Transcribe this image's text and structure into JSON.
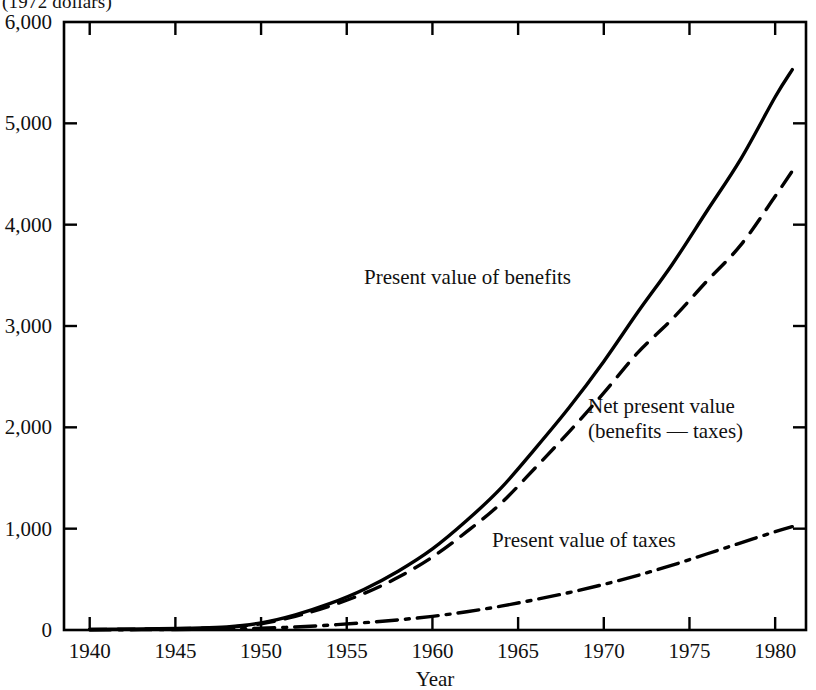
{
  "chart_data": {
    "type": "line",
    "title": "",
    "subtitle": "",
    "units_note": "(1972 dollars)",
    "xlabel": "Year",
    "ylabel": "",
    "xlim": [
      1938.5,
      1981.8
    ],
    "ylim": [
      0,
      6000
    ],
    "grid": false,
    "legend_position": "inline annotations",
    "xticks": [
      1940,
      1945,
      1950,
      1955,
      1960,
      1965,
      1970,
      1975,
      1980
    ],
    "xtick_labels": [
      "1940",
      "1945",
      "1950",
      "1955",
      "1960",
      "1965",
      "1970",
      "1975",
      "1980"
    ],
    "yticks": [
      0,
      1000,
      2000,
      3000,
      4000,
      5000,
      6000
    ],
    "ytick_labels": [
      "0",
      "1,000",
      "2,000",
      "3,000",
      "4,000",
      "5,000",
      "6,000"
    ],
    "x": [
      1940,
      1942,
      1944,
      1946,
      1948,
      1950,
      1952,
      1954,
      1956,
      1958,
      1960,
      1962,
      1964,
      1966,
      1968,
      1970,
      1972,
      1974,
      1976,
      1978,
      1980,
      1981
    ],
    "series": [
      {
        "name": "Present value of benefits",
        "style": "solid",
        "color": "#000000",
        "values": [
          5,
          8,
          12,
          18,
          30,
          70,
          150,
          260,
          400,
          580,
          800,
          1080,
          1400,
          1790,
          2200,
          2650,
          3140,
          3610,
          4130,
          4650,
          5260,
          5530
        ]
      },
      {
        "name": "Net present value (benefits − taxes)",
        "style": "dashed",
        "color": "#000000",
        "values": [
          5,
          8,
          11,
          16,
          26,
          62,
          135,
          235,
          360,
          520,
          720,
          970,
          1250,
          1600,
          1960,
          2340,
          2740,
          3070,
          3440,
          3800,
          4280,
          4530
        ]
      },
      {
        "name": "Present value of taxes",
        "style": "dash-dot",
        "color": "#000000",
        "values": [
          2,
          3,
          4,
          6,
          10,
          18,
          30,
          48,
          72,
          100,
          135,
          180,
          235,
          300,
          370,
          450,
          540,
          640,
          750,
          860,
          970,
          1020
        ]
      }
    ],
    "annotations": [
      {
        "name": "benefits-label",
        "text": "Present value of benefits",
        "x_px": 364,
        "y_px": 265
      },
      {
        "name": "net-present-value-label",
        "line1": "Net present value",
        "line2": "(benefits — taxes)",
        "x_px": 588,
        "y_px": 394
      },
      {
        "name": "taxes-label",
        "text": "Present value of taxes",
        "x_px": 492,
        "y_px": 528
      }
    ]
  },
  "labels": {
    "units_note": "(1972 dollars)",
    "xlabel": "Year",
    "benefits": "Present value of benefits",
    "npv_line1": "Net present value",
    "npv_line2": "(benefits — taxes)",
    "taxes": "Present value of taxes"
  }
}
